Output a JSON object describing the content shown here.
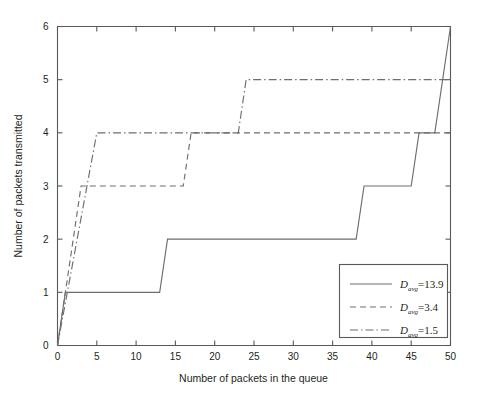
{
  "chart_data": {
    "type": "line",
    "title": "",
    "xlabel": "Number of packets in the queue",
    "ylabel": "Number of packets transmitted",
    "xlim": [
      0,
      50
    ],
    "ylim": [
      0,
      6
    ],
    "xticks": [
      0,
      5,
      10,
      15,
      20,
      25,
      30,
      35,
      40,
      45,
      50
    ],
    "yticks": [
      0,
      1,
      2,
      3,
      4,
      5,
      6
    ],
    "grid": false,
    "legend_position": "lower right",
    "series": [
      {
        "name": "D_avg=13.9",
        "label_var": "D",
        "label_sub": "avg",
        "label_value": "=13.9",
        "style": "solid",
        "points": [
          [
            0,
            0
          ],
          [
            1,
            1
          ],
          [
            13,
            1
          ],
          [
            14,
            2
          ],
          [
            38,
            2
          ],
          [
            39,
            3
          ],
          [
            45,
            3
          ],
          [
            46,
            4
          ],
          [
            48,
            4
          ],
          [
            50,
            6
          ]
        ]
      },
      {
        "name": "D_avg=3.4",
        "label_var": "D",
        "label_sub": "avg",
        "label_value": "=3.4",
        "style": "dashed",
        "points": [
          [
            0,
            0
          ],
          [
            3,
            3
          ],
          [
            16,
            3
          ],
          [
            17,
            4
          ],
          [
            50,
            4
          ]
        ]
      },
      {
        "name": "D_avg=1.5",
        "label_var": "D",
        "label_sub": "avg",
        "label_value": "=1.5",
        "style": "dashdot",
        "points": [
          [
            0,
            0
          ],
          [
            5,
            4
          ],
          [
            23,
            4
          ],
          [
            24,
            5
          ],
          [
            50,
            5
          ]
        ]
      }
    ]
  },
  "axes": {
    "x_tick_labels": [
      "0",
      "5",
      "10",
      "15",
      "20",
      "25",
      "30",
      "35",
      "40",
      "45",
      "50"
    ],
    "y_tick_labels": [
      "0",
      "1",
      "2",
      "3",
      "4",
      "5",
      "6"
    ],
    "x_title": "Number of packets in the queue",
    "y_title": "Number of packets transmitted"
  },
  "colors": {
    "line": "#6d6e71",
    "axis": "#58595b",
    "text": "#231f20",
    "background": "#ffffff"
  }
}
